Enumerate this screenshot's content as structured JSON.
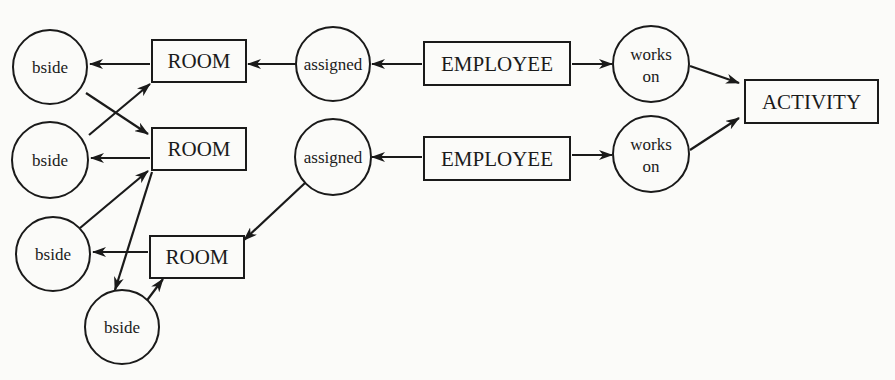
{
  "diagram": {
    "type": "entity-relationship graph",
    "colors": {
      "ink": "#1a1a1a",
      "paper": "#fbfbf9"
    },
    "entities": [
      {
        "id": "room1",
        "label": "ROOM",
        "x": 152,
        "y": 40,
        "w": 94,
        "h": 42
      },
      {
        "id": "room2",
        "label": "ROOM",
        "x": 152,
        "y": 128,
        "w": 94,
        "h": 42
      },
      {
        "id": "room3",
        "label": "ROOM",
        "x": 150,
        "y": 236,
        "w": 94,
        "h": 42
      },
      {
        "id": "employee1",
        "label": "EMPLOYEE",
        "x": 424,
        "y": 42,
        "w": 146,
        "h": 43
      },
      {
        "id": "employee2",
        "label": "EMPLOYEE",
        "x": 424,
        "y": 137,
        "w": 146,
        "h": 43
      },
      {
        "id": "activity",
        "label": "ACTIVITY",
        "x": 745,
        "y": 80,
        "w": 133,
        "h": 43
      }
    ],
    "relationships": [
      {
        "id": "bside1",
        "label": [
          "bside"
        ],
        "cx": 50,
        "cy": 67,
        "r": 37
      },
      {
        "id": "bside2",
        "label": [
          "bside"
        ],
        "cx": 50,
        "cy": 160,
        "r": 38
      },
      {
        "id": "bside3",
        "label": [
          "bside"
        ],
        "cx": 53,
        "cy": 254,
        "r": 37
      },
      {
        "id": "bside4",
        "label": [
          "bside"
        ],
        "cx": 122,
        "cy": 327,
        "r": 37
      },
      {
        "id": "assigned1",
        "label": [
          "assigned"
        ],
        "cx": 333,
        "cy": 64,
        "r": 37
      },
      {
        "id": "assigned2",
        "label": [
          "assigned"
        ],
        "cx": 333,
        "cy": 157,
        "r": 38
      },
      {
        "id": "workson1",
        "label": [
          "works",
          "on"
        ],
        "cx": 651,
        "cy": 64,
        "r": 38
      },
      {
        "id": "workson2",
        "label": [
          "works",
          "on"
        ],
        "cx": 651,
        "cy": 154,
        "r": 38
      }
    ],
    "edges": [
      {
        "from": "room1",
        "to": "bside1",
        "x1": 150,
        "y1": 64,
        "x2": 90,
        "y2": 64
      },
      {
        "from": "bside1",
        "to": "room2",
        "x1": 86,
        "y1": 93,
        "x2": 148,
        "y2": 134
      },
      {
        "from": "bside2",
        "to": "room1",
        "x1": 89,
        "y1": 135,
        "x2": 150,
        "y2": 84
      },
      {
        "from": "room2",
        "to": "bside2",
        "x1": 150,
        "y1": 158,
        "x2": 91,
        "y2": 158
      },
      {
        "from": "bside3",
        "to": "room2",
        "x1": 80,
        "y1": 228,
        "x2": 148,
        "y2": 171
      },
      {
        "from": "room2",
        "to": "bside4",
        "x1": 152,
        "y1": 172,
        "x2": 115,
        "y2": 290
      },
      {
        "from": "room3",
        "to": "bside3",
        "x1": 148,
        "y1": 252,
        "x2": 93,
        "y2": 252
      },
      {
        "from": "bside4",
        "to": "room3",
        "x1": 142,
        "y1": 307,
        "x2": 163,
        "y2": 279
      },
      {
        "from": "assigned1",
        "to": "room1",
        "x1": 296,
        "y1": 64,
        "x2": 248,
        "y2": 64
      },
      {
        "from": "employee1",
        "to": "assigned1",
        "x1": 422,
        "y1": 64,
        "x2": 372,
        "y2": 64
      },
      {
        "from": "assigned2",
        "to": "room3",
        "x1": 305,
        "y1": 183,
        "x2": 244,
        "y2": 240
      },
      {
        "from": "employee2",
        "to": "assigned2",
        "x1": 422,
        "y1": 157,
        "x2": 372,
        "y2": 157
      },
      {
        "from": "employee1",
        "to": "workson1",
        "x1": 572,
        "y1": 64,
        "x2": 612,
        "y2": 64
      },
      {
        "from": "employee2",
        "to": "workson2",
        "x1": 572,
        "y1": 155,
        "x2": 612,
        "y2": 155
      },
      {
        "from": "workson1",
        "to": "activity",
        "x1": 690,
        "y1": 66,
        "x2": 739,
        "y2": 83
      },
      {
        "from": "workson2",
        "to": "activity",
        "x1": 690,
        "y1": 150,
        "x2": 739,
        "y2": 118
      }
    ]
  }
}
